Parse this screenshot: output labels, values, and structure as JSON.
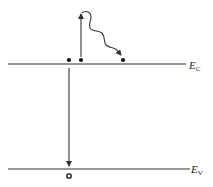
{
  "diagram": {
    "colors": {
      "line": "#333333",
      "background": "#ffffff"
    },
    "levels": {
      "conduction": {
        "symbol": "E",
        "subscript": "C",
        "y": 64,
        "x_start": 8,
        "x_end": 186
      },
      "valence": {
        "symbol": "E",
        "subscript": "V",
        "y": 169,
        "x_start": 8,
        "x_end": 190
      }
    },
    "electrons": [
      {
        "x": 69,
        "y": 60
      },
      {
        "x": 81,
        "y": 60
      },
      {
        "x": 123,
        "y": 60
      }
    ],
    "hole": {
      "x": 69,
      "y": 176
    },
    "arrows": {
      "excitation": {
        "type": "straight-up",
        "from": [
          81,
          58
        ],
        "to": [
          81,
          14
        ]
      },
      "relaxation": {
        "type": "wavy",
        "from": [
          82,
          14
        ],
        "to": [
          122,
          56
        ]
      },
      "recombination": {
        "type": "straight-down",
        "from": [
          69,
          67
        ],
        "to": [
          69,
          166
        ]
      }
    }
  }
}
